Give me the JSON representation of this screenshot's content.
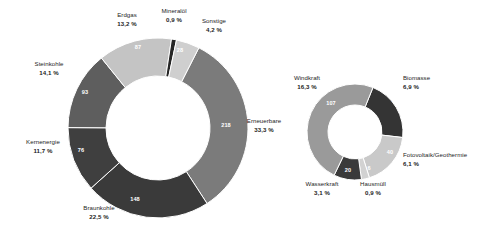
{
  "chart_data": [
    {
      "type": "pie",
      "id": "bruttostromerzeugung-gesamt",
      "title": "",
      "subtitle": "",
      "variant": "donut",
      "unit": "TWh",
      "total_value": 648,
      "legend": "outside-labels",
      "grid": false,
      "categories": [
        "Erneuerbare",
        "Braunkohle",
        "Kernenergie",
        "Steinkohle",
        "Erdgas",
        "Mineralöl",
        "Sonstige"
      ],
      "values": [
        218,
        148,
        76,
        93,
        87,
        6,
        28
      ],
      "percentages": [
        33.3,
        22.5,
        11.7,
        14.1,
        13.2,
        0.9,
        4.2
      ],
      "percent_labels": [
        "33,3 %",
        "22,5 %",
        "11,7 %",
        "14,1 %",
        "13,2 %",
        "0,9 %",
        "4,2 %"
      ],
      "value_labels": [
        "218",
        "148",
        "76",
        "93",
        "87",
        "",
        "28"
      ],
      "colors": [
        "#7b7b7b",
        "#3a3a3a",
        "#3f3f3f",
        "#5e5e5e",
        "#c4c4c4",
        "#262626",
        "#cfcfcf"
      ],
      "slices": [
        {
          "name": "Erneuerbare",
          "value": 218,
          "value_label": "218",
          "percent": 33.3,
          "percent_label": "33,3 %",
          "color": "#7b7b7b",
          "value_text_color": "#ffffff"
        },
        {
          "name": "Braunkohle",
          "value": 148,
          "value_label": "148",
          "percent": 22.5,
          "percent_label": "22,5 %",
          "color": "#3a3a3a",
          "value_text_color": "#ffffff"
        },
        {
          "name": "Kernenergie",
          "value": 76,
          "value_label": "76",
          "percent": 11.7,
          "percent_label": "11,7 %",
          "color": "#3f3f3f",
          "value_text_color": "#ffffff"
        },
        {
          "name": "Steinkohle",
          "value": 93,
          "value_label": "93",
          "percent": 14.1,
          "percent_label": "14,1 %",
          "color": "#5e5e5e",
          "value_text_color": "#ffffff"
        },
        {
          "name": "Erdgas",
          "value": 87,
          "value_label": "87",
          "percent": 13.2,
          "percent_label": "13,2 %",
          "color": "#c4c4c4",
          "value_text_color": "#ffffff"
        },
        {
          "name": "Mineralöl",
          "value": 6,
          "value_label": "",
          "percent": 0.9,
          "percent_label": "0,9 %",
          "color": "#262626",
          "value_text_color": "#ffffff"
        },
        {
          "name": "Sonstige",
          "value": 28,
          "value_label": "28",
          "percent": 4.2,
          "percent_label": "4,2 %",
          "color": "#cfcfcf",
          "value_text_color": "#ffffff"
        }
      ]
    },
    {
      "type": "pie",
      "id": "erneuerbare-aufschluesselung",
      "title": "",
      "subtitle": "",
      "variant": "donut",
      "unit": "TWh",
      "total_value": 218,
      "legend": "outside-labels",
      "grid": false,
      "categories": [
        "Biomasse",
        "Fotovoltaik/Geothermie",
        "Hausmüll",
        "Wasserkraft",
        "Windkraft"
      ],
      "values": [
        46,
        40,
        6,
        20,
        107
      ],
      "percentages": [
        6.9,
        6.1,
        0.9,
        3.1,
        16.3
      ],
      "percent_labels": [
        "6,9 %",
        "6,1 %",
        "0,9 %",
        "3,1 %",
        "16,3 %"
      ],
      "value_labels": [
        "46",
        "40",
        "6",
        "20",
        "107"
      ],
      "colors": [
        "#343434",
        "#c9c9c9",
        "#d2d2d2",
        "#3a3a3a",
        "#9a9a9a"
      ],
      "slices": [
        {
          "name": "Biomasse",
          "value": 46,
          "value_label": "46",
          "percent": 6.9,
          "percent_label": "6,9 %",
          "color": "#343434",
          "value_text_color": "#ffffff"
        },
        {
          "name": "Fotovoltaik/Geothermie",
          "value": 40,
          "value_label": "40",
          "percent": 6.1,
          "percent_label": "6,1 %",
          "color": "#c9c9c9",
          "value_text_color": "#ffffff"
        },
        {
          "name": "Hausmüll",
          "value": 6,
          "value_label": "6",
          "percent": 0.9,
          "percent_label": "0,9 %",
          "color": "#d2d2d2",
          "value_text_color": "#ffffff"
        },
        {
          "name": "Wasserkraft",
          "value": 20,
          "value_label": "20",
          "percent": 3.1,
          "percent_label": "3,1 %",
          "color": "#3a3a3a",
          "value_text_color": "#ffffff"
        },
        {
          "name": "Windkraft",
          "value": 107,
          "value_label": "107",
          "percent": 16.3,
          "percent_label": "16,3 %",
          "color": "#9a9a9a",
          "value_text_color": "#ffffff"
        }
      ]
    }
  ],
  "left_chart": {
    "labels": {
      "erdgas": {
        "name": "Erdgas",
        "percent": "13,2 %"
      },
      "mineraloel": {
        "name": "Mineralöl",
        "percent": "0,9 %"
      },
      "sonstige": {
        "name": "Sonstige",
        "percent": "4,2 %"
      },
      "erneuerbare": {
        "name": "Erneuerbare",
        "percent": "33,3 %"
      },
      "braunkohle": {
        "name": "Braunkohle",
        "percent": "22,5 %"
      },
      "kernenergie": {
        "name": "Kernenergie",
        "percent": "11,7 %"
      },
      "steinkohle": {
        "name": "Steinkohle",
        "percent": "14,1 %"
      }
    },
    "values": {
      "erdgas": "87",
      "sonstige": "28",
      "erneuerbare": "218",
      "braunkohle": "148",
      "kernenergie": "76",
      "steinkohle": "93"
    }
  },
  "right_chart": {
    "labels": {
      "windkraft": {
        "name": "Windkraft",
        "percent": "16,3 %"
      },
      "biomasse": {
        "name": "Biomasse",
        "percent": "6,9 %"
      },
      "fotovoltaik": {
        "name": "Fotovoltaik/Geothermie",
        "percent": "6,1 %"
      },
      "hausmuell": {
        "name": "Hausmüll",
        "percent": "0,9 %"
      },
      "wasserkraft": {
        "name": "Wasserkraft",
        "percent": "3,1 %"
      }
    },
    "values": {
      "windkraft": "107",
      "biomasse": "46",
      "fotovoltaik": "40",
      "hausmuell": "6",
      "wasserkraft": "20"
    }
  },
  "style": {
    "background": "#ffffff",
    "label_color": "#1d1d1d",
    "value_color": "#ffffff",
    "separator_color": "#ffffff"
  }
}
